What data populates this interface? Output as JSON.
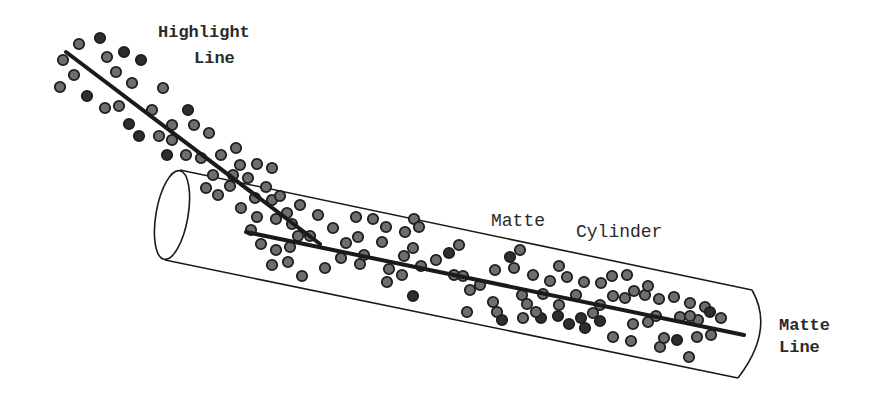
{
  "labels": {
    "highlight_line_1": "Highlight",
    "highlight_line_2": "Line",
    "matte_cylinder_1": "Matte",
    "matte_cylinder_2": "Cylinder",
    "matte_line_1": "Matte",
    "matte_line_2": "Line"
  },
  "colors": {
    "background": "#ffffff",
    "stroke": "#1a1a1a",
    "dot_fill_light": "#6e6e6e",
    "dot_fill_dark": "#2e2e2e",
    "dot_stroke": "#1e1e1e",
    "text": "#2a2a2a"
  },
  "shapes": {
    "highlight_line": {
      "x1": 66,
      "y1": 52,
      "x2": 320,
      "y2": 244
    },
    "matte_line": {
      "x1": 246,
      "y1": 232,
      "x2": 744,
      "y2": 335
    },
    "cylinder": {
      "end_ellipse": {
        "cx": 172,
        "cy": 215,
        "rx": 16,
        "ry": 45,
        "rotate": 10
      },
      "top_edge": {
        "x1": 180,
        "y1": 170,
        "x2": 752,
        "y2": 290
      },
      "bottom_edge": {
        "x1": 165,
        "y1": 260,
        "x2": 738,
        "y2": 378
      },
      "far_end_arc": "M 752 290 Q 775 330 738 378"
    },
    "dots": [
      [
        79,
        44,
        0
      ],
      [
        100,
        38,
        1
      ],
      [
        63,
        60,
        0
      ],
      [
        107,
        57,
        0
      ],
      [
        124,
        52,
        1
      ],
      [
        141,
        60,
        1
      ],
      [
        74,
        75,
        0
      ],
      [
        116,
        72,
        0
      ],
      [
        132,
        83,
        0
      ],
      [
        60,
        87,
        0
      ],
      [
        87,
        96,
        1
      ],
      [
        105,
        108,
        0
      ],
      [
        119,
        106,
        0
      ],
      [
        163,
        88,
        0
      ],
      [
        152,
        110,
        0
      ],
      [
        188,
        110,
        1
      ],
      [
        129,
        124,
        1
      ],
      [
        139,
        136,
        1
      ],
      [
        159,
        136,
        0
      ],
      [
        172,
        125,
        0
      ],
      [
        194,
        125,
        0
      ],
      [
        209,
        133,
        0
      ],
      [
        172,
        140,
        0
      ],
      [
        167,
        155,
        1
      ],
      [
        186,
        155,
        0
      ],
      [
        201,
        158,
        0
      ],
      [
        221,
        155,
        0
      ],
      [
        236,
        148,
        0
      ],
      [
        257,
        164,
        0
      ],
      [
        272,
        168,
        0
      ],
      [
        240,
        165,
        0
      ],
      [
        206,
        188,
        0
      ],
      [
        230,
        186,
        0
      ],
      [
        248,
        178,
        0
      ],
      [
        266,
        187,
        0
      ],
      [
        213,
        175,
        0
      ],
      [
        233,
        175,
        0
      ],
      [
        218,
        195,
        0
      ],
      [
        241,
        208,
        0
      ],
      [
        255,
        198,
        0
      ],
      [
        272,
        200,
        0
      ],
      [
        287,
        213,
        0
      ],
      [
        280,
        196,
        0
      ],
      [
        292,
        224,
        0
      ],
      [
        300,
        205,
        0
      ],
      [
        318,
        215,
        0
      ],
      [
        310,
        236,
        0
      ],
      [
        276,
        219,
        0
      ],
      [
        257,
        217,
        0
      ],
      [
        261,
        244,
        0
      ],
      [
        276,
        250,
        0
      ],
      [
        290,
        247,
        0
      ],
      [
        298,
        236,
        0
      ],
      [
        251,
        230,
        0
      ],
      [
        272,
        265,
        0
      ],
      [
        288,
        262,
        0
      ],
      [
        302,
        276,
        0
      ],
      [
        325,
        268,
        0
      ],
      [
        341,
        258,
        0
      ],
      [
        346,
        243,
        0
      ],
      [
        358,
        237,
        0
      ],
      [
        333,
        228,
        0
      ],
      [
        356,
        217,
        0
      ],
      [
        373,
        219,
        0
      ],
      [
        386,
        227,
        0
      ],
      [
        405,
        232,
        0
      ],
      [
        414,
        219,
        0
      ],
      [
        419,
        227,
        0
      ],
      [
        413,
        248,
        0
      ],
      [
        404,
        256,
        0
      ],
      [
        382,
        242,
        0
      ],
      [
        360,
        264,
        0
      ],
      [
        364,
        255,
        0
      ],
      [
        389,
        269,
        0
      ],
      [
        387,
        282,
        0
      ],
      [
        402,
        275,
        0
      ],
      [
        413,
        296,
        1
      ],
      [
        421,
        266,
        0
      ],
      [
        436,
        260,
        0
      ],
      [
        449,
        253,
        1
      ],
      [
        459,
        245,
        0
      ],
      [
        454,
        275,
        0
      ],
      [
        463,
        276,
        0
      ],
      [
        470,
        290,
        0
      ],
      [
        480,
        285,
        0
      ],
      [
        495,
        270,
        0
      ],
      [
        510,
        257,
        1
      ],
      [
        514,
        268,
        0
      ],
      [
        520,
        250,
        0
      ],
      [
        533,
        275,
        0
      ],
      [
        550,
        281,
        0
      ],
      [
        559,
        266,
        0
      ],
      [
        567,
        277,
        0
      ],
      [
        543,
        294,
        0
      ],
      [
        522,
        295,
        0
      ],
      [
        493,
        302,
        0
      ],
      [
        467,
        312,
        0
      ],
      [
        497,
        312,
        0
      ],
      [
        502,
        320,
        1
      ],
      [
        523,
        318,
        0
      ],
      [
        541,
        318,
        1
      ],
      [
        558,
        316,
        1
      ],
      [
        569,
        324,
        1
      ],
      [
        581,
        318,
        1
      ],
      [
        585,
        328,
        1
      ],
      [
        593,
        313,
        0
      ],
      [
        600,
        321,
        1
      ],
      [
        613,
        296,
        0
      ],
      [
        625,
        298,
        0
      ],
      [
        634,
        291,
        0
      ],
      [
        645,
        295,
        0
      ],
      [
        659,
        299,
        0
      ],
      [
        674,
        297,
        0
      ],
      [
        680,
        317,
        0
      ],
      [
        690,
        303,
        0
      ],
      [
        705,
        307,
        0
      ],
      [
        710,
        312,
        1
      ],
      [
        721,
        318,
        0
      ],
      [
        698,
        320,
        0
      ],
      [
        697,
        337,
        0
      ],
      [
        711,
        335,
        0
      ],
      [
        677,
        340,
        1
      ],
      [
        660,
        347,
        0
      ],
      [
        664,
        338,
        0
      ],
      [
        689,
        357,
        0
      ],
      [
        631,
        341,
        0
      ],
      [
        613,
        337,
        0
      ],
      [
        576,
        295,
        0
      ],
      [
        584,
        282,
        0
      ],
      [
        601,
        283,
        0
      ],
      [
        612,
        276,
        0
      ],
      [
        627,
        275,
        0
      ],
      [
        648,
        286,
        0
      ],
      [
        600,
        305,
        0
      ],
      [
        559,
        305,
        0
      ],
      [
        527,
        304,
        0
      ],
      [
        536,
        312,
        0
      ],
      [
        648,
        322,
        0
      ],
      [
        656,
        316,
        0
      ],
      [
        690,
        316,
        0
      ],
      [
        633,
        324,
        0
      ]
    ]
  }
}
